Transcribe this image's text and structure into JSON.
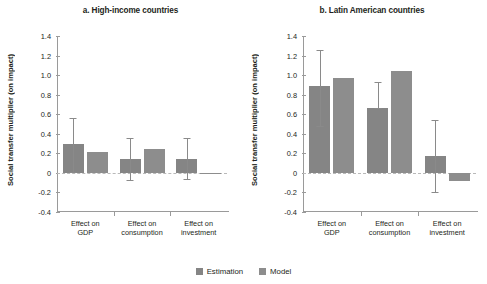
{
  "chart_data": {
    "type": "bar",
    "title": "",
    "panels": [
      {
        "id": "a",
        "title": "a. High-income countries",
        "ylabel": "Social transfer multiplier (on impact)",
        "xlabel": "",
        "ylim": [
          -0.4,
          1.4
        ],
        "yticks": [
          1.4,
          1.2,
          1.0,
          0.8,
          0.6,
          0.4,
          0.2,
          0,
          -0.2,
          -0.4
        ],
        "ytick_labels": [
          "1.4",
          "1.2",
          "1.0",
          "0.8",
          "0.6",
          "0.4",
          "0.2",
          "0",
          "-0.2",
          "-0.4"
        ],
        "categories": [
          "Effect on\nGDP",
          "Effect on\nconsumption",
          "Effect on\ninvestment"
        ],
        "series": [
          {
            "name": "Estimation",
            "color": "#858585",
            "values": [
              0.3,
              0.14,
              0.14
            ],
            "error_low": [
              0.01,
              -0.07,
              -0.06
            ],
            "error_high": [
              0.56,
              0.36,
              0.36
            ]
          },
          {
            "name": "Model",
            "color": "#8d8d8d",
            "values": [
              0.21,
              0.24,
              -0.01
            ],
            "error_low": [
              null,
              null,
              null
            ],
            "error_high": [
              null,
              null,
              null
            ]
          }
        ]
      },
      {
        "id": "b",
        "title": "b. Latin American countries",
        "ylabel": "Social transfer multiplier (on impact)",
        "xlabel": "",
        "ylim": [
          -0.4,
          1.4
        ],
        "yticks": [
          1.4,
          1.2,
          1.0,
          0.8,
          0.6,
          0.4,
          0.2,
          0,
          -0.2,
          -0.4
        ],
        "ytick_labels": [
          "1.4",
          "1.2",
          "1.0",
          "0.8",
          "0.6",
          "0.4",
          "0.2",
          "0",
          "-0.2",
          "-0.4"
        ],
        "categories": [
          "Effect on\nGDP",
          "Effect on\nconsumption",
          "Effect on\ninvestment"
        ],
        "series": [
          {
            "name": "Estimation",
            "color": "#858585",
            "values": [
              0.89,
              0.66,
              0.17
            ],
            "error_low": [
              0.48,
              0.66,
              -0.2
            ],
            "error_high": [
              1.26,
              0.93,
              0.54
            ]
          },
          {
            "name": "Model",
            "color": "#8d8d8d",
            "values": [
              0.97,
              1.04,
              -0.08
            ],
            "error_low": [
              null,
              null,
              null
            ],
            "error_high": [
              null,
              null,
              null
            ]
          }
        ]
      }
    ],
    "legend": {
      "position": "bottom-center",
      "entries": [
        {
          "label": "Estimation",
          "color": "#858585"
        },
        {
          "label": "Model",
          "color": "#8d8d8d"
        }
      ]
    },
    "grid": false
  }
}
